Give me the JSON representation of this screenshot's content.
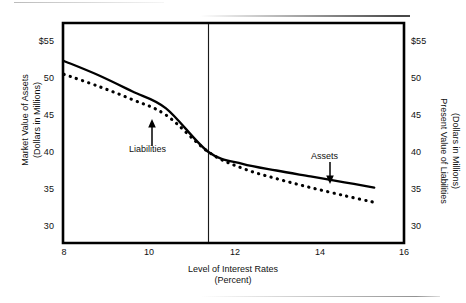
{
  "chart_data": {
    "type": "line",
    "title": "",
    "xlabel": "Level of Interest Rates (Percent)",
    "ylabel": "Market Value of Assets (Dollars in Millions)",
    "y2label": "Present Value of Liabilities (Dollars in Millions)",
    "xlim": [
      8,
      16
    ],
    "ylim": [
      30,
      55
    ],
    "grid": false,
    "legend": "none (inline annotations with arrows)",
    "xticks": [
      "8",
      "10",
      "12",
      "14",
      "16"
    ],
    "xtick_values": [
      8,
      10,
      12,
      14,
      16
    ],
    "yticks": [
      "$55",
      "50",
      "45",
      "40",
      "35",
      "30"
    ],
    "ytick_values": [
      55,
      50,
      45,
      40,
      35,
      30
    ],
    "y2ticks": [
      "$55",
      "50",
      "45",
      "40",
      "35",
      "30"
    ],
    "y2tick_values": [
      55,
      50,
      45,
      40,
      35,
      30
    ],
    "series": [
      {
        "name": "Assets",
        "style": "solid",
        "color": "#000000",
        "x": [
          8.0,
          8.8,
          9.6,
          10.4,
          11.4,
          12.2,
          13.0,
          13.8,
          14.6,
          15.3
        ],
        "values": [
          52.3,
          50.4,
          48.2,
          45.9,
          40.0,
          38.4,
          37.5,
          36.7,
          35.9,
          35.2
        ]
      },
      {
        "name": "Liabilities",
        "style": "dotted",
        "color": "#000000",
        "x": [
          8.0,
          8.8,
          9.6,
          10.4,
          11.4,
          12.2,
          13.0,
          13.8,
          14.6,
          15.3
        ],
        "values": [
          50.5,
          48.9,
          47.1,
          45.0,
          40.0,
          37.8,
          36.4,
          35.2,
          34.1,
          33.2
        ]
      }
    ],
    "annotations": [
      {
        "label": "Liabilities",
        "points_to": "Liabilities",
        "arrow": "up",
        "x": 9.9,
        "y": 44.5
      },
      {
        "label": "Assets",
        "points_to": "Assets",
        "arrow": "down",
        "x": 14.1,
        "y": 37.8
      }
    ],
    "reference_line": {
      "orientation": "vertical",
      "x": 11.4,
      "label": ""
    }
  },
  "axes": {
    "left_title_line1": "Market Value of Assets",
    "left_title_line2": "(Dollars in Millions)",
    "right_title_line1": "Present Value of Liabilities",
    "right_title_line2": "(Dollars in Millions)",
    "bottom_title_line1": "Level of Interest Rates",
    "bottom_title_line2": "(Percent)"
  }
}
